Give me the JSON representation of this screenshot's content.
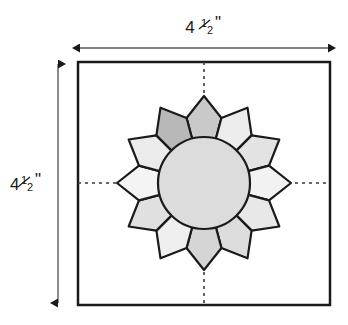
{
  "figure": {
    "kind": "quilt-block-diagram",
    "title_visible": false,
    "background_color": "#ffffff",
    "line_color": "#1a1a1a"
  },
  "dimensions": {
    "width_label": "4½\"",
    "height_label": "4½\"",
    "width_whole": "4",
    "width_fraction_numerator": "1",
    "width_fraction_denominator": "2",
    "width_unit": "\"",
    "height_whole": "4",
    "height_fraction_numerator": "1",
    "height_fraction_denominator": "2",
    "height_unit": "\""
  },
  "block": {
    "border_color": "#1a1a1a",
    "fill_color": "#ffffff",
    "border_width": 2.5,
    "x": 78,
    "y": 62,
    "width": 252,
    "height": 243
  },
  "center_guides": {
    "style": "dashed",
    "color": "#3a3a3a",
    "vertical_x": 204,
    "horizontal_y": 183
  },
  "rosette": {
    "center_x": 204,
    "center_y": 183,
    "petal_count": 12,
    "inner_circle": {
      "radius": 46,
      "fill": "#dcdcdc",
      "stroke": "#1a1a1a"
    },
    "petal_outer_radius": 87,
    "petal_stroke": "#1a1a1a",
    "petal_shades": [
      "#c9c9c9",
      "#ededed",
      "#e3e3e3",
      "#f2f2f2",
      "#e8e8e8",
      "#dcdcdc",
      "#d5d5d5",
      "#efefef",
      "#e0e0e0",
      "#f4f4f4",
      "#ebebeb",
      "#b8b8b8"
    ],
    "petal_positions_clock": [
      "12:00",
      "1:00",
      "2:00",
      "3:00",
      "4:00",
      "5:00",
      "6:00",
      "7:00",
      "8:00",
      "9:00",
      "10:00",
      "11:00"
    ]
  },
  "arrows": {
    "top": {
      "orientation": "horizontal",
      "double_headed": true,
      "x1": 78,
      "x2": 330,
      "y": 48,
      "color": "#3a3a3a"
    },
    "left": {
      "orientation": "vertical",
      "double_headed": true,
      "y1": 62,
      "y2": 305,
      "x": 58,
      "color": "#3a3a3a"
    }
  }
}
